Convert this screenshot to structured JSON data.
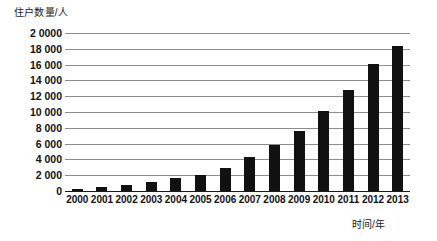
{
  "chart_data": {
    "type": "bar",
    "title": "",
    "subtitle": "",
    "xlabel": "时间/年",
    "ylabel": "住户数量/人",
    "categories": [
      "2000",
      "2001",
      "2002",
      "2003",
      "2004",
      "2005",
      "2006",
      "2007",
      "2008",
      "2009",
      "2010",
      "2011",
      "2012",
      "2013"
    ],
    "values": [
      250,
      450,
      700,
      1100,
      1600,
      2000,
      2900,
      4300,
      5800,
      7600,
      10100,
      12800,
      16100,
      18300
    ],
    "ylim": [
      0,
      20000
    ],
    "ytick_step": 2000,
    "ytick_labels": [
      "0",
      "2 000",
      "4 000",
      "6 000",
      "8 000",
      "10 000",
      "12 000",
      "14 000",
      "16 000",
      "18 000",
      "2 0000"
    ],
    "ytick_values": [
      0,
      2000,
      4000,
      6000,
      8000,
      10000,
      12000,
      14000,
      16000,
      18000,
      20000
    ],
    "grid": true,
    "legend": false,
    "legend_position": "none",
    "bar_color": "#111111",
    "grid_color": "#8c8c8c",
    "axis_color": "#1a1a1a",
    "text_color": "#111111"
  }
}
